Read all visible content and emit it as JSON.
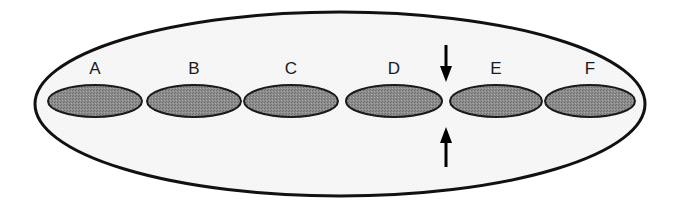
{
  "diagram": {
    "container": {
      "shape": "ellipse",
      "cx": 340,
      "cy": 104,
      "rx": 305,
      "ry": 92,
      "fill": "#f6f6f6",
      "stroke": "#111111"
    },
    "segments": [
      {
        "label": "A",
        "cx": 95,
        "cy": 101,
        "rx": 47,
        "ry": 16
      },
      {
        "label": "B",
        "cx": 194,
        "cy": 101,
        "rx": 47,
        "ry": 16
      },
      {
        "label": "C",
        "cx": 291,
        "cy": 101,
        "rx": 47,
        "ry": 16
      },
      {
        "label": "D",
        "cx": 394,
        "cy": 101,
        "rx": 48,
        "ry": 16
      },
      {
        "label": "E",
        "cx": 496,
        "cy": 101,
        "rx": 46,
        "ry": 16
      },
      {
        "label": "F",
        "cx": 590,
        "cy": 101,
        "rx": 45,
        "ry": 16
      }
    ],
    "segment_fill": "#8c8c8c",
    "segment_stroke": "#1a1a1a",
    "label_y": 74,
    "constriction_arrows": {
      "x": 446,
      "top": {
        "direction": "down",
        "y_start": 45,
        "y_end": 82
      },
      "bottom": {
        "direction": "up",
        "y_start": 167,
        "y_end": 127
      },
      "color": "#000000"
    }
  }
}
